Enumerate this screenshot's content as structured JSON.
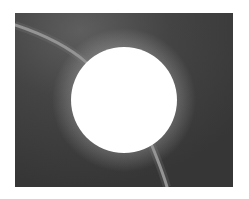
{
  "image": {
    "description": "Grayscale photograph: bright white disk occulting center of a dark field, with a thin light arc passing behind it",
    "colors": {
      "page_background": "#ffffff",
      "field": "#3b3b3b",
      "field_glow": "#5a5a5a",
      "disk": "#ffffff",
      "arc": "#9c9c9c"
    },
    "frame": {
      "x": 15,
      "y": 13,
      "width": 218,
      "height": 174
    },
    "disk": {
      "cx": 109,
      "cy": 87,
      "r": 53
    },
    "arc": {
      "path": "M0,12 C30,22 55,35 70,48 L70,48 C95,70 125,100 135,128 C142,145 148,160 152,174"
    }
  }
}
